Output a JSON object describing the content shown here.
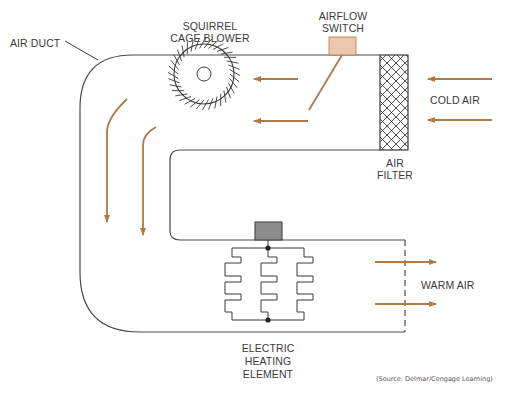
{
  "diagram": {
    "labels": {
      "air_duct": "AIR DUCT",
      "blower_line1": "SQUIRREL",
      "blower_line2": "CAGE BLOWER",
      "switch_line1": "AIRFLOW",
      "switch_line2": "SWITCH",
      "cold_air": "COLD AIR",
      "filter_line1": "AIR",
      "filter_line2": "FILTER",
      "warm_air": "WARM AIR",
      "heater_line1": "ELECTRIC",
      "heater_line2": "HEATING",
      "heater_line3": "ELEMENT"
    },
    "source": "(Source: Delmar/Cengage Learning)",
    "components": [
      "air-duct",
      "squirrel-cage-blower",
      "airflow-switch",
      "air-filter",
      "electric-heating-element"
    ],
    "colors": {
      "line": "#4a4a4a",
      "arrow": "#b07a48",
      "switch_fill": "#ecc8ae",
      "heater_box": "#8c8c8c",
      "background": "#ffffff"
    }
  }
}
